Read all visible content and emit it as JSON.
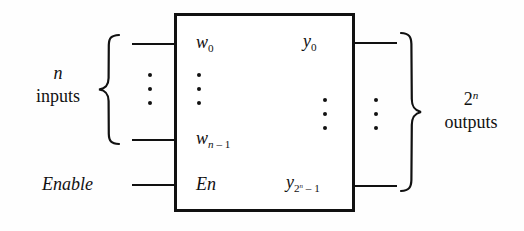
{
  "figure": {
    "background_color": "#fefefe",
    "line_color": "#111111"
  },
  "block": {
    "name": "decoder-block",
    "inputs": [
      {
        "id": "w0",
        "base": "w",
        "sub": "0",
        "label": "w0"
      },
      {
        "id": "wn1",
        "base": "w",
        "sub": "n – 1",
        "label": "wn-1"
      },
      {
        "id": "en",
        "base": "En",
        "sub": "",
        "label": "En"
      }
    ],
    "outputs": [
      {
        "id": "y0",
        "base": "y",
        "sub": "0",
        "label": "y0"
      },
      {
        "id": "y2n1",
        "base": "y",
        "sub": "2^n – 1",
        "label": "y2^n-1"
      }
    ]
  },
  "pins": {
    "w0": {
      "base": "w",
      "sub": "0"
    },
    "wn_minus_1": {
      "base": "w",
      "sub_var": "n",
      "sub_op": " – 1"
    },
    "en": {
      "text": "En"
    },
    "y0": {
      "base": "y",
      "sub": "0"
    },
    "y_2n_minus_1": {
      "base": "y",
      "sub_base": "2",
      "sub_exp": "n",
      "sub_op": " – 1"
    }
  },
  "annotations": {
    "enable_label": "Enable",
    "left_group": {
      "count_symbol": "n",
      "noun": "inputs"
    },
    "right_group": {
      "count_base": "2",
      "count_exp": "n",
      "noun": "outputs"
    }
  },
  "ellipsis": {
    "dot_count": 3,
    "columns": [
      {
        "name": "left-outer-ellipsis"
      },
      {
        "name": "left-inner-ellipsis"
      },
      {
        "name": "right-inner-ellipsis"
      },
      {
        "name": "right-outer-ellipsis"
      }
    ]
  }
}
